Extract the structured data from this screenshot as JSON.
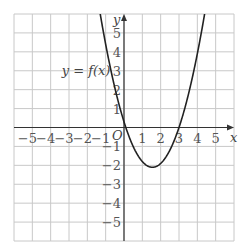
{
  "chart_data": {
    "type": "line",
    "title": "",
    "curve_label": "y = f(x)",
    "xlabel": "x",
    "ylabel": "y",
    "origin_label": "O",
    "xlim": [
      -6,
      6
    ],
    "ylim": [
      -6,
      6
    ],
    "grid": true,
    "x_ticks": [
      -5,
      -4,
      -3,
      -2,
      -1,
      1,
      2,
      3,
      4,
      5
    ],
    "y_ticks": [
      -5,
      -4,
      -3,
      -2,
      -1,
      1,
      2,
      3,
      4,
      5
    ],
    "series": [
      {
        "name": "y = f(x)",
        "description": "Upward parabola with roots near x = 0.1 and x = 3, minimum near (1.55, -2.1)",
        "x": [
          -1.3,
          -1,
          -0.5,
          0,
          0.1,
          0.5,
          1,
          1.55,
          2,
          2.5,
          3,
          3.5,
          4,
          4.4
        ],
        "y": [
          6.0,
          4.4,
          1.9,
          -0.3,
          0,
          -1.0,
          -1.8,
          -2.1,
          -1.9,
          -1.2,
          0,
          1.7,
          3.6,
          6.0
        ]
      }
    ],
    "colors": {
      "grid": "#c8c8c8",
      "axis": "#333333",
      "curve": "#222222",
      "text": "#555555"
    }
  }
}
